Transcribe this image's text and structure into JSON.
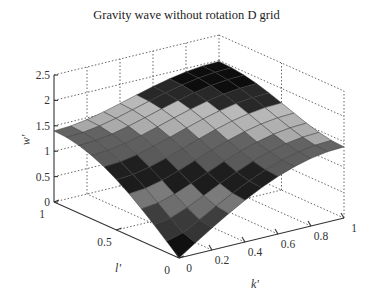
{
  "chart_data": {
    "type": "surface",
    "title": "Gravity wave without rotation D grid",
    "xlabel": "k'",
    "ylabel": "l'",
    "zlabel": "w'",
    "xlim": [
      0,
      1
    ],
    "ylim": [
      0,
      1
    ],
    "zlim": [
      0,
      2.5
    ],
    "x_ticks": [
      "0",
      "0.2",
      "0.4",
      "0.6",
      "0.8",
      "1"
    ],
    "y_ticks": [
      "0",
      "0.5",
      "1"
    ],
    "z_ticks": [
      "0",
      "0.5",
      "1",
      "1.5",
      "2",
      "2.5"
    ],
    "grid": true,
    "colormap": "gray",
    "grid_resolution": 11,
    "function": "w' = 1.4 * sqrt(sin^2(pi k'/2) + sin^2(pi l'/2))",
    "sample_values": [
      {
        "k": 0,
        "l": 0,
        "w": 0
      },
      {
        "k": 1,
        "l": 0,
        "w": 1.4
      },
      {
        "k": 0,
        "l": 1,
        "w": 1.4
      },
      {
        "k": 1,
        "l": 1,
        "w": 1.98
      }
    ]
  }
}
